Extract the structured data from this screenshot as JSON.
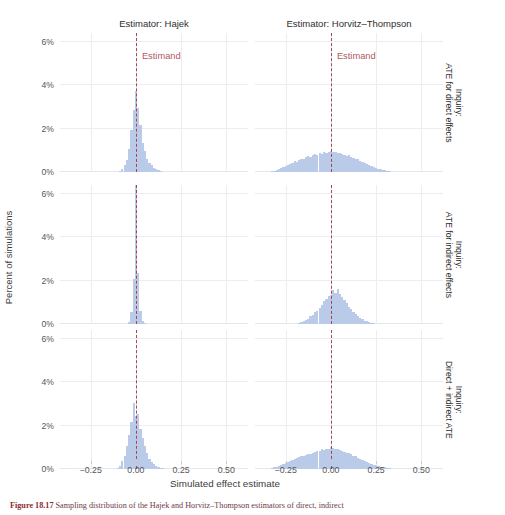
{
  "figure": {
    "x_axis_title": "Simulated effect estimate",
    "y_axis_title": "Percent of simulations",
    "estimand_label": "Estimand",
    "caption_prefix": "Figure 18.17",
    "caption_text": " Sampling distribution of the Hajek and Horvitz–Thompson estimators of direct, indirect"
  },
  "colors": {
    "bar_fill": "#b9cbe8",
    "estimand_line": "#a33b46",
    "estimand_text": "#b05a63",
    "grid": "#ebedf2",
    "panel_bg": "#ffffff",
    "axis_text": "#565656",
    "strip_text": "#2e2e2e"
  },
  "columns": [
    {
      "id": "hajek",
      "label": "Estimator: Hajek"
    },
    {
      "id": "ht",
      "label": "Estimator: Horvitz–Thompson"
    }
  ],
  "rows": [
    {
      "id": "direct",
      "line1": "Inquiry:",
      "line2": "ATE for direct effects"
    },
    {
      "id": "indirect",
      "line1": "Inquiry:",
      "line2": "ATE for indirect effects"
    },
    {
      "id": "both",
      "line1": "Inquiry:",
      "line2": "Direct + indirect ATE"
    }
  ],
  "axes": {
    "x_ticks": [
      -0.25,
      0.0,
      0.25,
      0.5
    ],
    "x_tick_labels": [
      "−0.25",
      "0.00",
      "0.25",
      "0.50"
    ],
    "x_min": -0.42,
    "x_max": 0.62,
    "y_ticks": [
      0,
      2,
      4,
      6
    ],
    "y_tick_labels": [
      "0%",
      "2%",
      "4%",
      "6%"
    ],
    "y_min": 0,
    "y_max": 6.4,
    "grid": true
  },
  "chart_data": {
    "type": "histogram",
    "title": "",
    "xlabel": "Simulated effect estimate",
    "ylabel": "Percent of simulations",
    "xlim": [
      -0.42,
      0.62
    ],
    "ylim": [
      0,
      6.4
    ],
    "bin_width": 0.0125,
    "facet_rows": [
      "ATE for direct effects",
      "ATE for indirect effects",
      "Direct + indirect ATE"
    ],
    "facet_cols": [
      "Estimator: Hajek",
      "Estimator: Horvitz–Thompson"
    ],
    "estimand_value": 0.0,
    "panels": [
      {
        "row": "direct",
        "col": "hajek",
        "estimand": 0.0,
        "bins": [
          {
            "x": -0.0875,
            "y": 0.05
          },
          {
            "x": -0.075,
            "y": 0.12
          },
          {
            "x": -0.0625,
            "y": 0.3
          },
          {
            "x": -0.05,
            "y": 0.55
          },
          {
            "x": -0.0375,
            "y": 1.05
          },
          {
            "x": -0.025,
            "y": 1.95
          },
          {
            "x": -0.0125,
            "y": 2.85
          },
          {
            "x": 0.0,
            "y": 3.75
          },
          {
            "x": 0.0125,
            "y": 2.95
          },
          {
            "x": 0.025,
            "y": 2.15
          },
          {
            "x": 0.0375,
            "y": 1.35
          },
          {
            "x": 0.05,
            "y": 0.95
          },
          {
            "x": 0.0625,
            "y": 0.6
          },
          {
            "x": 0.075,
            "y": 0.42
          },
          {
            "x": 0.0875,
            "y": 0.3
          },
          {
            "x": 0.1,
            "y": 0.2
          },
          {
            "x": 0.1125,
            "y": 0.12
          },
          {
            "x": 0.125,
            "y": 0.08
          },
          {
            "x": 0.1375,
            "y": 0.04
          }
        ]
      },
      {
        "row": "direct",
        "col": "ht",
        "estimand": 0.0,
        "bins": [
          {
            "x": -0.3,
            "y": 0.08
          },
          {
            "x": -0.2875,
            "y": 0.12
          },
          {
            "x": -0.275,
            "y": 0.18
          },
          {
            "x": -0.2625,
            "y": 0.22
          },
          {
            "x": -0.25,
            "y": 0.28
          },
          {
            "x": -0.2375,
            "y": 0.32
          },
          {
            "x": -0.225,
            "y": 0.38
          },
          {
            "x": -0.2125,
            "y": 0.42
          },
          {
            "x": -0.2,
            "y": 0.5
          },
          {
            "x": -0.1875,
            "y": 0.48
          },
          {
            "x": -0.175,
            "y": 0.55
          },
          {
            "x": -0.1625,
            "y": 0.62
          },
          {
            "x": -0.15,
            "y": 0.58
          },
          {
            "x": -0.1375,
            "y": 0.68
          },
          {
            "x": -0.125,
            "y": 0.72
          },
          {
            "x": -0.1125,
            "y": 0.7
          },
          {
            "x": -0.1,
            "y": 0.78
          },
          {
            "x": -0.0875,
            "y": 0.82
          },
          {
            "x": -0.075,
            "y": 0.8
          },
          {
            "x": -0.0625,
            "y": 0.86
          },
          {
            "x": -0.05,
            "y": 0.84
          },
          {
            "x": -0.0375,
            "y": 0.9
          },
          {
            "x": -0.025,
            "y": 0.88
          },
          {
            "x": -0.0125,
            "y": 0.92
          },
          {
            "x": 0.0,
            "y": 0.95
          },
          {
            "x": 0.0125,
            "y": 0.9
          },
          {
            "x": 0.025,
            "y": 0.94
          },
          {
            "x": 0.0375,
            "y": 0.88
          },
          {
            "x": 0.05,
            "y": 0.86
          },
          {
            "x": 0.0625,
            "y": 0.82
          },
          {
            "x": 0.075,
            "y": 0.8
          },
          {
            "x": 0.0875,
            "y": 0.74
          },
          {
            "x": 0.1,
            "y": 0.78
          },
          {
            "x": 0.1125,
            "y": 0.7
          },
          {
            "x": 0.125,
            "y": 0.66
          },
          {
            "x": 0.1375,
            "y": 0.6
          },
          {
            "x": 0.15,
            "y": 0.58
          },
          {
            "x": 0.1625,
            "y": 0.52
          },
          {
            "x": 0.175,
            "y": 0.46
          },
          {
            "x": 0.1875,
            "y": 0.42
          },
          {
            "x": 0.2,
            "y": 0.36
          },
          {
            "x": 0.2125,
            "y": 0.32
          },
          {
            "x": 0.225,
            "y": 0.28
          },
          {
            "x": 0.2375,
            "y": 0.22
          },
          {
            "x": 0.25,
            "y": 0.2
          },
          {
            "x": 0.2625,
            "y": 0.16
          },
          {
            "x": 0.275,
            "y": 0.13
          },
          {
            "x": 0.2875,
            "y": 0.1
          },
          {
            "x": 0.3,
            "y": 0.08
          },
          {
            "x": 0.3125,
            "y": 0.06
          },
          {
            "x": 0.325,
            "y": 0.04
          },
          {
            "x": -0.3125,
            "y": 0.05
          },
          {
            "x": -0.325,
            "y": 0.04
          }
        ]
      },
      {
        "row": "indirect",
        "col": "hajek",
        "estimand": 0.0,
        "bins": [
          {
            "x": -0.0375,
            "y": 0.1
          },
          {
            "x": -0.025,
            "y": 0.55
          },
          {
            "x": -0.0125,
            "y": 2.05
          },
          {
            "x": 0.0,
            "y": 6.4
          },
          {
            "x": 0.0125,
            "y": 2.35
          },
          {
            "x": 0.025,
            "y": 0.6
          },
          {
            "x": 0.0375,
            "y": 0.15
          },
          {
            "x": 0.05,
            "y": 0.06
          }
        ]
      },
      {
        "row": "indirect",
        "col": "ht",
        "estimand": 0.0,
        "bins": [
          {
            "x": -0.175,
            "y": 0.05
          },
          {
            "x": -0.1625,
            "y": 0.08
          },
          {
            "x": -0.15,
            "y": 0.12
          },
          {
            "x": -0.1375,
            "y": 0.18
          },
          {
            "x": -0.125,
            "y": 0.25
          },
          {
            "x": -0.1125,
            "y": 0.35
          },
          {
            "x": -0.1,
            "y": 0.42
          },
          {
            "x": -0.0875,
            "y": 0.55
          },
          {
            "x": -0.075,
            "y": 0.62
          },
          {
            "x": -0.0625,
            "y": 0.75
          },
          {
            "x": -0.05,
            "y": 0.88
          },
          {
            "x": -0.0375,
            "y": 1.05
          },
          {
            "x": -0.025,
            "y": 1.15
          },
          {
            "x": -0.0125,
            "y": 1.3
          },
          {
            "x": 0.0,
            "y": 1.35
          },
          {
            "x": 0.0125,
            "y": 1.55
          },
          {
            "x": 0.025,
            "y": 1.45
          },
          {
            "x": 0.0375,
            "y": 1.6
          },
          {
            "x": 0.05,
            "y": 1.4
          },
          {
            "x": 0.0625,
            "y": 1.25
          },
          {
            "x": 0.075,
            "y": 1.1
          },
          {
            "x": 0.0875,
            "y": 0.95
          },
          {
            "x": 0.1,
            "y": 0.8
          },
          {
            "x": 0.1125,
            "y": 0.68
          },
          {
            "x": 0.125,
            "y": 0.55
          },
          {
            "x": 0.1375,
            "y": 0.45
          },
          {
            "x": 0.15,
            "y": 0.35
          },
          {
            "x": 0.1625,
            "y": 0.28
          },
          {
            "x": 0.175,
            "y": 0.22
          },
          {
            "x": 0.1875,
            "y": 0.16
          },
          {
            "x": 0.2,
            "y": 0.12
          },
          {
            "x": 0.2125,
            "y": 0.09
          },
          {
            "x": 0.225,
            "y": 0.06
          },
          {
            "x": 0.2375,
            "y": 0.04
          }
        ]
      },
      {
        "row": "both",
        "col": "hajek",
        "estimand": 0.0,
        "bins": [
          {
            "x": -0.1,
            "y": 0.06
          },
          {
            "x": -0.0875,
            "y": 0.15
          },
          {
            "x": -0.075,
            "y": 0.35
          },
          {
            "x": -0.0625,
            "y": 0.62
          },
          {
            "x": -0.05,
            "y": 1.05
          },
          {
            "x": -0.0375,
            "y": 1.55
          },
          {
            "x": -0.025,
            "y": 2.15
          },
          {
            "x": -0.0125,
            "y": 3.05
          },
          {
            "x": 0.0,
            "y": 2.45
          },
          {
            "x": 0.0125,
            "y": 2.55
          },
          {
            "x": 0.025,
            "y": 1.85
          },
          {
            "x": 0.0375,
            "y": 1.45
          },
          {
            "x": 0.05,
            "y": 1.05
          },
          {
            "x": 0.0625,
            "y": 0.72
          },
          {
            "x": 0.075,
            "y": 0.48
          },
          {
            "x": 0.0875,
            "y": 0.32
          },
          {
            "x": 0.1,
            "y": 0.22
          },
          {
            "x": 0.1125,
            "y": 0.15
          },
          {
            "x": 0.125,
            "y": 0.1
          },
          {
            "x": 0.1375,
            "y": 0.06
          },
          {
            "x": 0.15,
            "y": 0.04
          }
        ]
      },
      {
        "row": "both",
        "col": "ht",
        "estimand": 0.0,
        "bins": [
          {
            "x": -0.325,
            "y": 0.05
          },
          {
            "x": -0.3125,
            "y": 0.07
          },
          {
            "x": -0.3,
            "y": 0.1
          },
          {
            "x": -0.2875,
            "y": 0.14
          },
          {
            "x": -0.275,
            "y": 0.18
          },
          {
            "x": -0.2625,
            "y": 0.22
          },
          {
            "x": -0.25,
            "y": 0.26
          },
          {
            "x": -0.2375,
            "y": 0.3
          },
          {
            "x": -0.225,
            "y": 0.36
          },
          {
            "x": -0.2125,
            "y": 0.4
          },
          {
            "x": -0.2,
            "y": 0.44
          },
          {
            "x": -0.1875,
            "y": 0.5
          },
          {
            "x": -0.175,
            "y": 0.54
          },
          {
            "x": -0.1625,
            "y": 0.6
          },
          {
            "x": -0.15,
            "y": 0.58
          },
          {
            "x": -0.1375,
            "y": 0.66
          },
          {
            "x": -0.125,
            "y": 0.7
          },
          {
            "x": -0.1125,
            "y": 0.68
          },
          {
            "x": -0.1,
            "y": 0.76
          },
          {
            "x": -0.0875,
            "y": 0.8
          },
          {
            "x": -0.075,
            "y": 0.84
          },
          {
            "x": -0.0625,
            "y": 0.82
          },
          {
            "x": -0.05,
            "y": 0.9
          },
          {
            "x": -0.0375,
            "y": 0.88
          },
          {
            "x": -0.025,
            "y": 0.94
          },
          {
            "x": -0.0125,
            "y": 0.92
          },
          {
            "x": 0.0,
            "y": 1.0
          },
          {
            "x": 0.0125,
            "y": 0.96
          },
          {
            "x": 0.025,
            "y": 0.9
          },
          {
            "x": 0.0375,
            "y": 0.92
          },
          {
            "x": 0.05,
            "y": 0.86
          },
          {
            "x": 0.0625,
            "y": 0.84
          },
          {
            "x": 0.075,
            "y": 0.8
          },
          {
            "x": 0.0875,
            "y": 0.76
          },
          {
            "x": 0.1,
            "y": 0.72
          },
          {
            "x": 0.1125,
            "y": 0.68
          },
          {
            "x": 0.125,
            "y": 0.62
          },
          {
            "x": 0.1375,
            "y": 0.58
          },
          {
            "x": 0.15,
            "y": 0.52
          },
          {
            "x": 0.1625,
            "y": 0.48
          },
          {
            "x": 0.175,
            "y": 0.42
          },
          {
            "x": 0.1875,
            "y": 0.38
          },
          {
            "x": 0.2,
            "y": 0.34
          },
          {
            "x": 0.2125,
            "y": 0.28
          },
          {
            "x": 0.225,
            "y": 0.24
          },
          {
            "x": 0.2375,
            "y": 0.2
          },
          {
            "x": 0.25,
            "y": 0.17
          },
          {
            "x": 0.2625,
            "y": 0.14
          },
          {
            "x": 0.275,
            "y": 0.11
          },
          {
            "x": 0.2875,
            "y": 0.09
          },
          {
            "x": 0.3,
            "y": 0.07
          },
          {
            "x": 0.3125,
            "y": 0.05
          },
          {
            "x": 0.325,
            "y": 0.04
          }
        ]
      }
    ]
  }
}
